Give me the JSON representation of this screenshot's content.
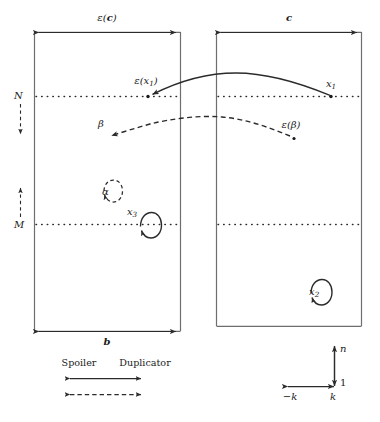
{
  "figure": {
    "type": "ehrenfeucht-fraisse-game-board-diagram",
    "boxes": [
      {
        "name": "left-block",
        "x": 34,
        "y": 32,
        "width": 147,
        "height": 299,
        "top_label": "ε(c)",
        "bottom_label": "b"
      },
      {
        "name": "right-block",
        "x": 216,
        "y": 32,
        "width": 146,
        "height": 294,
        "top_label": "c",
        "bottom_label": ""
      }
    ],
    "dimension_labels": {
      "left_top": "ε(c)",
      "right_top": "c",
      "left_bottom": "b"
    },
    "dotted_lines": [
      {
        "name": "N-line",
        "label": "N",
        "y": 96
      },
      {
        "name": "M-line",
        "label": "M",
        "y": 224
      }
    ],
    "margin_axis": {
      "upper_label": "N",
      "lower_label": "M",
      "upper_arrow_direction": "down",
      "lower_arrow_direction": "up"
    },
    "points": [
      {
        "name": "epsilon-x1-point",
        "label": "ε(x₁)",
        "base": "ε(x",
        "sub": "1",
        "close": ")",
        "x": 148,
        "y": 96
      },
      {
        "name": "x1-point",
        "label": "x₁",
        "base": "x",
        "sub": "1",
        "close": "",
        "x": 331,
        "y": 96
      },
      {
        "name": "beta-point",
        "label": "β",
        "base": "β",
        "sub": "",
        "close": "",
        "x": 107,
        "y": 137
      },
      {
        "name": "epsilon-beta-point",
        "label": "ε(β)",
        "base": "ε(β)",
        "sub": "",
        "close": "",
        "x": 291,
        "y": 137
      },
      {
        "name": "alpha-loop",
        "label": "α",
        "base": "α",
        "sub": "",
        "close": "",
        "x": 98,
        "y": 192
      },
      {
        "name": "x3-loop",
        "label": "x₃",
        "base": "x",
        "sub": "3",
        "close": "",
        "x": 141,
        "y": 224
      },
      {
        "name": "x2-loop",
        "label": "x₂",
        "base": "x",
        "sub": "2",
        "close": "",
        "x": 302,
        "y": 292
      }
    ],
    "arrows": [
      {
        "name": "spoiler-move-x1",
        "style": "solid",
        "from": "x1-point",
        "to": "epsilon-x1-point"
      },
      {
        "name": "duplicator-move-beta",
        "style": "dashed",
        "from": "beta-point",
        "to": "epsilon-beta-point"
      }
    ],
    "legend": {
      "spoiler_label": "Spoiler",
      "duplicator_label": "Duplicator",
      "spoiler_style": "solid",
      "duplicator_style": "dashed"
    },
    "axis_key": {
      "vertical_top_label": "n",
      "vertical_bottom_label": "1",
      "horizontal_left_label": "−k",
      "horizontal_right_label": "k"
    },
    "colors": {
      "stroke": "#2b2b2b",
      "box_stroke": "#6e6e6e",
      "text": "#1a1a1a",
      "background": "#ffffff"
    }
  }
}
